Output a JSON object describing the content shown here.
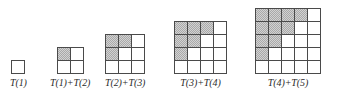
{
  "canvas": {
    "width": 342,
    "height": 89,
    "background": "#ffffff"
  },
  "style": {
    "grid_line_color": "#4a4a4a",
    "cell_fill_color": "#ffffff",
    "shaded_fill_color": "#d2d2d2",
    "shaded_dither_color": "#a9a9a9",
    "caption_color": "#2b2b2b",
    "cell_size_px": 12
  },
  "chart_data": {
    "type": "diagram",
    "figures": [
      {
        "index": 1,
        "label": "T(1)",
        "size": 1,
        "left_px": 10,
        "shaded_per_row": [
          0
        ],
        "shaded_count": 0,
        "total_cells": 1,
        "rows": [
          [
            false
          ]
        ]
      },
      {
        "index": 2,
        "label": "T(1)+T(2)",
        "size": 2,
        "left_px": 50,
        "shaded_per_row": [
          1,
          0
        ],
        "shaded_count": 1,
        "total_cells": 4,
        "rows": [
          [
            true,
            false
          ],
          [
            false,
            false
          ]
        ]
      },
      {
        "index": 3,
        "label": "T(2)+T(3)",
        "size": 3,
        "left_px": 105,
        "shaded_per_row": [
          2,
          1,
          0
        ],
        "shaded_count": 3,
        "total_cells": 9,
        "rows": [
          [
            true,
            true,
            false
          ],
          [
            true,
            false,
            false
          ],
          [
            false,
            false,
            false
          ]
        ]
      },
      {
        "index": 4,
        "label": "T(3)+T(4)",
        "size": 4,
        "left_px": 174,
        "shaded_per_row": [
          3,
          2,
          1,
          0
        ],
        "shaded_count": 6,
        "total_cells": 16,
        "rows": [
          [
            true,
            true,
            true,
            false
          ],
          [
            true,
            true,
            false,
            false
          ],
          [
            true,
            false,
            false,
            false
          ],
          [
            false,
            false,
            false,
            false
          ]
        ]
      },
      {
        "index": 5,
        "label": "T(4)+T(5)",
        "size": 5,
        "left_px": 255,
        "shaded_per_row": [
          4,
          3,
          2,
          1,
          0
        ],
        "shaded_count": 10,
        "total_cells": 25,
        "rows": [
          [
            true,
            true,
            true,
            true,
            false
          ],
          [
            true,
            true,
            true,
            false,
            false
          ],
          [
            true,
            true,
            false,
            false,
            false
          ],
          [
            true,
            false,
            false,
            false,
            false
          ],
          [
            false,
            false,
            false,
            false,
            false
          ]
        ]
      }
    ]
  }
}
